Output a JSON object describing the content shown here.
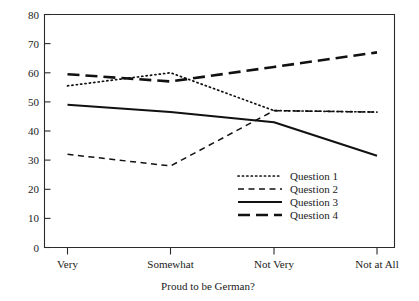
{
  "chart_data": {
    "type": "line",
    "title": "",
    "xlabel": "Proud to be German?",
    "ylabel": "",
    "categories": [
      "Very",
      "Somewhat",
      "Not Very",
      "Not at All"
    ],
    "ylim": [
      0,
      80
    ],
    "yticks": [
      0,
      10,
      20,
      30,
      40,
      50,
      60,
      70,
      80
    ],
    "grid": false,
    "legend_position": "inside lower-right",
    "series": [
      {
        "name": "Question 1",
        "style": "dotted",
        "values": [
          55.5,
          60.0,
          47.0,
          46.5
        ]
      },
      {
        "name": "Question 2",
        "style": "dashed",
        "values": [
          32.0,
          28.0,
          47.0,
          46.5
        ]
      },
      {
        "name": "Question 3",
        "style": "solid",
        "values": [
          49.0,
          46.5,
          43.0,
          31.5
        ]
      },
      {
        "name": "Question 4",
        "style": "long-dash",
        "values": [
          59.5,
          57.0,
          62.0,
          67.0
        ]
      }
    ]
  },
  "axes": {
    "y_tick_labels": [
      "80",
      "70",
      "60",
      "50",
      "40",
      "30",
      "20",
      "10",
      "0"
    ],
    "x_tick_labels": [
      "Very",
      "Somewhat",
      "Not Very",
      "Not at All"
    ],
    "x_axis_title": "Proud to be German?"
  },
  "legend": {
    "entries": [
      {
        "label": "Question 1",
        "style": "dotted"
      },
      {
        "label": "Question 2",
        "style": "dashed"
      },
      {
        "label": "Question 3",
        "style": "solid"
      },
      {
        "label": "Question 4",
        "style": "long-dash"
      }
    ]
  },
  "colors": {
    "ink": "#1a1a1a",
    "axis": "#2b2b2b",
    "background": "#ffffff"
  }
}
